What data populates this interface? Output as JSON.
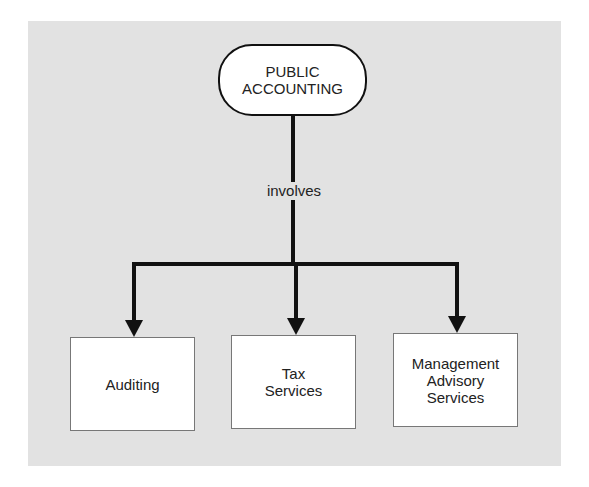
{
  "diagram": {
    "root": {
      "lines": [
        "PUBLIC",
        "ACCOUNTING"
      ]
    },
    "relation_label": "involves",
    "children": [
      {
        "lines": [
          "Auditing"
        ]
      },
      {
        "lines": [
          "Tax",
          "Services"
        ]
      },
      {
        "lines": [
          "Management",
          "Advisory",
          "Services"
        ]
      }
    ]
  }
}
